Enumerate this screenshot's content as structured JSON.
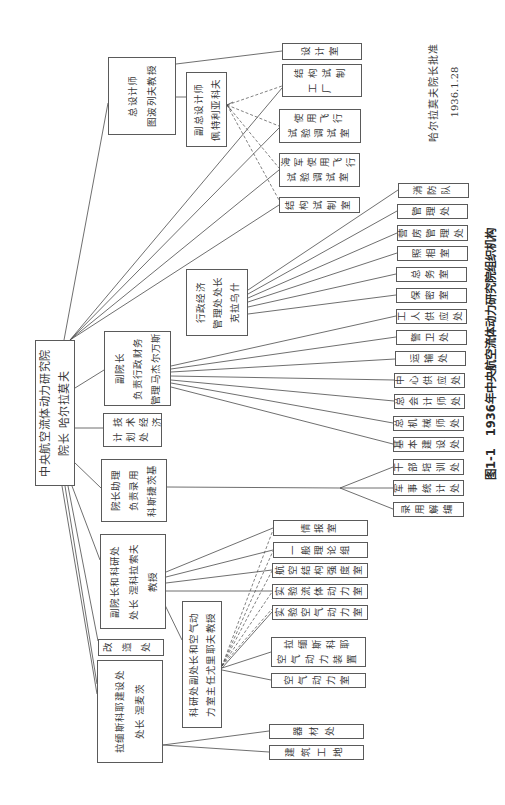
{
  "figure": {
    "caption_number": "图1-1",
    "caption_title": "1936年中央航空流体动力研究院组织机构",
    "approval_text": "哈尔拉莫夫院长批准",
    "approval_date": "1936.1.28"
  },
  "org": {
    "root": {
      "lines": [
        "中央航空流体动力研究院",
        "院长 哈尔拉莫夫"
      ]
    },
    "chief_designer": {
      "lines": [
        "总设计师",
        "图波列夫教授"
      ]
    },
    "deputy_chief_designer": {
      "lines": [
        "副总设计师",
        "佩特利亚科夫"
      ]
    },
    "design_units": [
      {
        "lines": [
          "设计室"
        ]
      },
      {
        "lines": [
          "结构试制",
          "工厂"
        ]
      },
      {
        "lines": [
          "使用飞行",
          "试验调试室"
        ]
      },
      {
        "lines": [
          "海军使用飞行",
          "试验调试室"
        ]
      },
      {
        "lines": [
          "结构试制室"
        ]
      }
    ],
    "admin_econ_dept": {
      "lines": [
        "行政经济",
        "管理处处长",
        "克拉乌什"
      ]
    },
    "vice_director_admin": {
      "lines": [
        "副院长",
        "负责行政财务",
        "管理马杰尔万斯"
      ]
    },
    "tech_econ_planning": {
      "lines": [
        "技术经济",
        "计划处"
      ]
    },
    "director_assistant": {
      "lines": [
        "院长助理",
        "负责录用",
        "科斯捷茨基"
      ]
    },
    "vice_director_research": {
      "lines": [
        "副院长和科研处",
        "处长 涅科拉索夫",
        "教授"
      ]
    },
    "reconstruction_dept": {
      "lines": [
        "改造处"
      ]
    },
    "ramenskoye_construction": {
      "lines": [
        "拉缅斯科耶建设处",
        "处长 涅麦茨"
      ]
    },
    "research_deputy": {
      "lines": [
        "科研处副处长和空气动",
        "力室主任尤里耶夫教授"
      ]
    },
    "admin_units": [
      "消防队",
      "管理处",
      "营房管理处",
      "照相室",
      "总务室",
      "保密室",
      "工人供应处",
      "警卫处",
      "运输处",
      "中心供应处",
      "总会计师处",
      "总机械师处",
      "基本建设处",
      "干部培训处",
      "军事统计处",
      "录用解编"
    ],
    "research_units": [
      {
        "lines": [
          "情报室"
        ]
      },
      {
        "lines": [
          "一般理论组"
        ]
      },
      {
        "lines": [
          "航空结构强度室"
        ]
      },
      {
        "lines": [
          "实验流体动力室"
        ]
      },
      {
        "lines": [
          "实验空气动力室"
        ]
      },
      {
        "lines": [
          "拉缅斯科耶",
          "空气动力装置"
        ]
      },
      {
        "lines": [
          "空气动力室"
        ]
      }
    ],
    "construction_units": [
      "器材处",
      "建筑工地"
    ]
  }
}
